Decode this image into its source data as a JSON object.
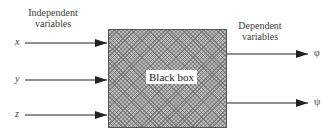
{
  "diagram": {
    "type": "block-diagram",
    "input_group_label": [
      "Independent",
      "variables"
    ],
    "output_group_label": [
      "Dependent",
      "variables"
    ],
    "box_label": "Black box",
    "inputs": [
      {
        "symbol": "x"
      },
      {
        "symbol": "y"
      },
      {
        "symbol": "z"
      }
    ],
    "outputs": [
      {
        "symbol": "φ"
      },
      {
        "symbol": "ψ"
      }
    ],
    "colors": {
      "box_fill": "#b8b8b8",
      "box_border": "#555555",
      "arrow": "#222222",
      "background": "#ffffff"
    }
  }
}
